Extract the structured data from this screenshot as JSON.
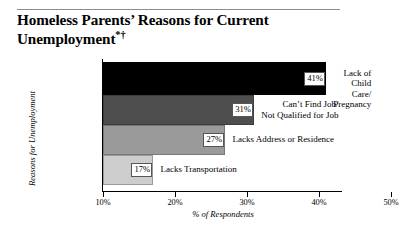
{
  "header": {
    "title_line1": "Homeless Parents’ Reasons for Current",
    "title_line2": "Unemployment",
    "title_footnote": "*†"
  },
  "chart_data": {
    "type": "bar",
    "orientation": "horizontal",
    "title": "Homeless Parents’ Reasons for Current Unemployment*†",
    "xlabel": "% of Respondents",
    "ylabel": "Reasons for Unemployment",
    "xlim": [
      10,
      50
    ],
    "xticks": [
      "10%",
      "20%",
      "30%",
      "40%",
      "50%"
    ],
    "xtick_values": [
      10,
      20,
      30,
      40,
      50
    ],
    "grid": false,
    "legend": "none",
    "categories": [
      "Lack of Child Care/ Pregnancy",
      "Can’t Find Job/ Not Qualified for Job",
      "Lacks Address or Residence",
      "Lacks Transportation"
    ],
    "values": [
      41,
      31,
      27,
      17
    ],
    "value_labels": [
      "41%",
      "31%",
      "27%",
      "17%"
    ],
    "bars": [
      {
        "value": 41,
        "label": "41%",
        "cat_line1": "Lack of Child Care/",
        "cat_line2": "Pregnancy",
        "color": "#000000"
      },
      {
        "value": 31,
        "label": "31%",
        "cat_line1": "Can’t Find Job/",
        "cat_line2": "Not Qualified for Job",
        "color": "#4e4e4e"
      },
      {
        "value": 27,
        "label": "27%",
        "cat_line1": "Lacks Address or Residence",
        "cat_line2": "",
        "color": "#9a9a9a"
      },
      {
        "value": 17,
        "label": "17%",
        "cat_line1": "Lacks Transportation",
        "cat_line2": "",
        "color": "#cdcdcd"
      }
    ]
  }
}
